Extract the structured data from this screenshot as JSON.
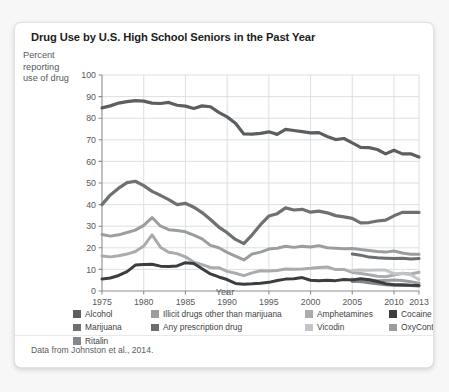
{
  "card": {
    "title": "Drug Use by U.S. High School Seniors in the Past Year",
    "caption": "Data from Johnston et al., 2014."
  },
  "axes": {
    "ylabel_line1": "Percent",
    "ylabel_line2": "reporting",
    "ylabel_line3": "use of drug",
    "xlabel": "Year"
  },
  "legend": {
    "columns": [
      {
        "left": 0,
        "items": [
          {
            "label": "Alcohol",
            "color": "#5c5f62"
          },
          {
            "label": "Marijuana",
            "color": "#6e7173"
          },
          {
            "label": "Ritalin",
            "color": "#84878a"
          }
        ]
      },
      {
        "left": 78,
        "items": [
          {
            "label": "Illicit drugs other than marijuana",
            "color": "#9b9ea0"
          },
          {
            "label": "Any prescription drug",
            "color": "#6b6e70"
          }
        ]
      },
      {
        "left": 232,
        "items": [
          {
            "label": "Amphetamines",
            "color": "#a9acae"
          },
          {
            "label": "Vicodin",
            "color": "#c2c5c7"
          }
        ]
      },
      {
        "left": 316,
        "items": [
          {
            "label": "Cocaine",
            "color": "#3b3e40"
          },
          {
            "label": "OxyContin",
            "color": "#9b9ea0"
          }
        ]
      }
    ]
  },
  "chart_data": {
    "type": "line",
    "title": "Drug Use by U.S. High School Seniors in the Past Year",
    "xlabel": "Year",
    "ylabel": "Percent reporting use of drug",
    "xlim": [
      1975,
      2013
    ],
    "ylim": [
      0,
      100
    ],
    "xticks": [
      1975,
      1980,
      1985,
      1990,
      1995,
      2000,
      2005,
      2010,
      2013
    ],
    "yticks": [
      0,
      10,
      20,
      30,
      40,
      50,
      60,
      70,
      80,
      90,
      100
    ],
    "grid": true,
    "legend_position": "bottom",
    "series": [
      {
        "name": "Alcohol",
        "color": "#5c5f62",
        "width": 3.2,
        "x": [
          1975,
          1976,
          1977,
          1978,
          1979,
          1980,
          1981,
          1982,
          1983,
          1984,
          1985,
          1986,
          1987,
          1988,
          1989,
          1990,
          1991,
          1992,
          1993,
          1994,
          1995,
          1996,
          1997,
          1998,
          1999,
          2000,
          2001,
          2002,
          2003,
          2004,
          2005,
          2006,
          2007,
          2008,
          2009,
          2010,
          2011,
          2012,
          2013
        ],
        "y": [
          84.8,
          85.7,
          87.0,
          87.7,
          88.1,
          87.9,
          87.0,
          86.8,
          87.3,
          86.0,
          85.6,
          84.5,
          85.7,
          85.3,
          82.7,
          80.6,
          77.7,
          72.7,
          72.6,
          73.0,
          73.7,
          72.5,
          74.8,
          74.3,
          73.8,
          73.2,
          73.3,
          71.5,
          70.1,
          70.6,
          68.6,
          66.5,
          66.4,
          65.5,
          63.5,
          65.2,
          63.5,
          63.5,
          62.0
        ]
      },
      {
        "name": "Marijuana",
        "color": "#6e7173",
        "width": 3.2,
        "x": [
          1975,
          1976,
          1977,
          1978,
          1979,
          1980,
          1981,
          1982,
          1983,
          1984,
          1985,
          1986,
          1987,
          1988,
          1989,
          1990,
          1991,
          1992,
          1993,
          1994,
          1995,
          1996,
          1997,
          1998,
          1999,
          2000,
          2001,
          2002,
          2003,
          2004,
          2005,
          2006,
          2007,
          2008,
          2009,
          2010,
          2011,
          2012,
          2013
        ],
        "y": [
          40.0,
          44.5,
          47.6,
          50.2,
          50.8,
          48.8,
          46.1,
          44.3,
          42.3,
          40.0,
          40.6,
          38.8,
          36.3,
          33.1,
          29.6,
          27.0,
          23.9,
          21.9,
          26.0,
          30.7,
          34.7,
          35.8,
          38.5,
          37.5,
          37.8,
          36.5,
          37.0,
          36.2,
          34.9,
          34.3,
          33.6,
          31.5,
          31.7,
          32.4,
          32.8,
          34.8,
          36.4,
          36.4,
          36.4
        ]
      },
      {
        "name": "Illicit drugs other than marijuana",
        "color": "#9b9ea0",
        "width": 3.0,
        "x": [
          1975,
          1976,
          1977,
          1978,
          1979,
          1980,
          1981,
          1982,
          1983,
          1984,
          1985,
          1986,
          1987,
          1988,
          1989,
          1990,
          1991,
          1992,
          1993,
          1994,
          1995,
          1996,
          1997,
          1998,
          1999,
          2000,
          2001,
          2002,
          2003,
          2004,
          2005,
          2006,
          2007,
          2008,
          2009,
          2010,
          2011,
          2012,
          2013
        ],
        "y": [
          26.2,
          25.4,
          26.0,
          27.1,
          28.2,
          30.4,
          34.0,
          30.1,
          28.4,
          28.0,
          27.4,
          25.9,
          24.1,
          21.1,
          20.0,
          17.9,
          16.2,
          14.4,
          17.1,
          18.0,
          19.4,
          19.8,
          20.7,
          20.2,
          20.7,
          20.4,
          21.0,
          20.0,
          19.8,
          19.6,
          19.7,
          19.2,
          18.8,
          18.3,
          18.0,
          18.5,
          17.6,
          17.0,
          17.0
        ]
      },
      {
        "name": "Amphetamines",
        "color": "#a9acae",
        "width": 3.0,
        "x": [
          1975,
          1976,
          1977,
          1978,
          1979,
          1980,
          1981,
          1982,
          1983,
          1984,
          1985,
          1986,
          1987,
          1988,
          1989,
          1990,
          1991,
          1992,
          1993,
          1994,
          1995,
          1996,
          1997,
          1998,
          1999,
          2000,
          2001,
          2002,
          2003,
          2004,
          2005,
          2006,
          2007,
          2008,
          2009,
          2010,
          2011,
          2012,
          2013
        ],
        "y": [
          16.2,
          15.8,
          16.3,
          17.1,
          18.3,
          20.8,
          26.0,
          20.3,
          17.9,
          17.3,
          15.8,
          13.4,
          12.2,
          10.9,
          10.8,
          9.1,
          8.2,
          7.1,
          8.4,
          9.4,
          9.3,
          9.5,
          10.2,
          10.1,
          10.2,
          10.5,
          10.9,
          11.1,
          9.9,
          10.0,
          8.6,
          8.1,
          7.5,
          6.8,
          6.6,
          7.4,
          8.2,
          7.9,
          8.7
        ]
      },
      {
        "name": "Cocaine",
        "color": "#3b3e40",
        "width": 3.0,
        "x": [
          1975,
          1976,
          1977,
          1978,
          1979,
          1980,
          1981,
          1982,
          1983,
          1984,
          1985,
          1986,
          1987,
          1988,
          1989,
          1990,
          1991,
          1992,
          1993,
          1994,
          1995,
          1996,
          1997,
          1998,
          1999,
          2000,
          2001,
          2002,
          2003,
          2004,
          2005,
          2006,
          2007,
          2008,
          2009,
          2010,
          2011,
          2012,
          2013
        ],
        "y": [
          5.6,
          6.0,
          7.2,
          9.0,
          12.0,
          12.3,
          12.4,
          11.5,
          11.4,
          11.6,
          13.1,
          12.7,
          10.3,
          7.9,
          6.5,
          5.3,
          3.5,
          3.1,
          3.3,
          3.6,
          4.0,
          4.9,
          5.5,
          5.7,
          6.2,
          5.0,
          4.8,
          5.0,
          4.8,
          5.3,
          5.1,
          5.7,
          5.2,
          4.4,
          3.4,
          2.9,
          2.9,
          2.7,
          2.6
        ]
      },
      {
        "name": "Any prescription drug",
        "color": "#6b6e70",
        "width": 3.0,
        "x": [
          2005,
          2006,
          2007,
          2008,
          2009,
          2010,
          2011,
          2012,
          2013
        ],
        "y": [
          17.1,
          16.6,
          15.7,
          15.4,
          15.2,
          15.0,
          15.2,
          14.8,
          15.0
        ]
      },
      {
        "name": "Vicodin",
        "color": "#c2c5c7",
        "width": 3.0,
        "x": [
          2005,
          2006,
          2007,
          2008,
          2009,
          2010,
          2011,
          2012,
          2013
        ],
        "y": [
          9.5,
          9.7,
          9.6,
          9.7,
          9.7,
          8.0,
          8.1,
          7.5,
          5.3
        ]
      },
      {
        "name": "OxyContin",
        "color": "#9b9ea0",
        "width": 3.0,
        "x": [
          2005,
          2006,
          2007,
          2008,
          2009,
          2010,
          2011,
          2012,
          2013
        ],
        "y": [
          5.5,
          4.3,
          5.2,
          4.7,
          4.9,
          5.1,
          4.9,
          4.3,
          3.6
        ]
      },
      {
        "name": "Ritalin",
        "color": "#84878a",
        "width": 3.0,
        "x": [
          2005,
          2006,
          2007,
          2008,
          2009,
          2010,
          2011,
          2012,
          2013
        ],
        "y": [
          4.4,
          4.4,
          3.8,
          3.4,
          2.9,
          2.7,
          2.6,
          2.6,
          2.3
        ]
      }
    ]
  }
}
